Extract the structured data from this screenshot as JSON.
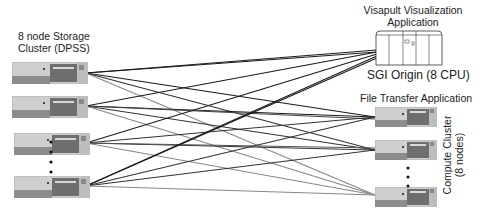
{
  "storage": {
    "title_line1": "8 node Storage",
    "title_line2": "Cluster (DPSS)",
    "node_count": 8,
    "visible_nodes": 4
  },
  "visualization": {
    "title_line1": "Visapult Visualization",
    "title_line2": "Application",
    "machine_label": "SGI Origin (8 CPU)"
  },
  "transfer": {
    "title": "File Transfer Application"
  },
  "compute": {
    "title_line1": "Compute Cluster",
    "title_line2": "(8 nodes)",
    "visible_nodes": 3
  },
  "colors": {
    "wire_dark": "#222222",
    "wire_light": "#8a8a8a",
    "server_body": "#c8c8c8",
    "server_dark": "#7a7a7a"
  }
}
